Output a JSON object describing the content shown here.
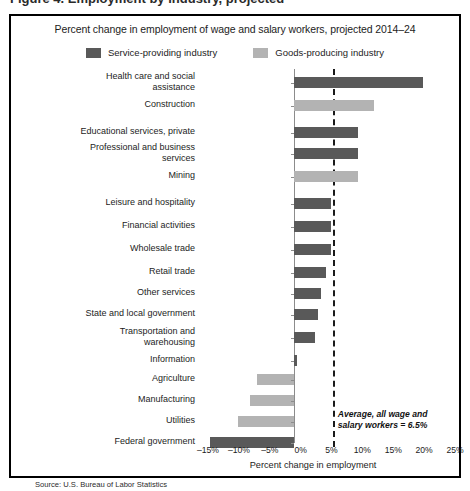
{
  "figure": {
    "clipped_header_text": "Figure 4. Employment by industry, projected",
    "source": "Source: U.S. Bureau of Labor Statistics"
  },
  "legend": {
    "entries": [
      {
        "label": "Service-providing industry",
        "color": "#595959",
        "key": "service"
      },
      {
        "label": "Goods-producing industry",
        "color": "#b3b3b3",
        "key": "goods"
      }
    ]
  },
  "chart_data": {
    "type": "bar",
    "orientation": "horizontal",
    "title": "Percent change in employment of wage and salary workers, projected 2014–24",
    "xlabel": "Percent change in employment",
    "ylabel": "",
    "xlim": [
      -15,
      25
    ],
    "xticks": [
      -15,
      -10,
      -5,
      0,
      5,
      10,
      15,
      20,
      25
    ],
    "xtick_labels": [
      "–15%",
      "–10%",
      "–5%",
      "0%",
      "5%",
      "10%",
      "15%",
      "20%",
      "25%"
    ],
    "grid": false,
    "legend_position": "top-center",
    "series": [
      {
        "name": "Service-providing industry",
        "color": "#595959"
      },
      {
        "name": "Goods-producing industry",
        "color": "#b3b3b3"
      }
    ],
    "categories": [
      "Health care and social\nassistance",
      "Construction",
      "Educational services, private",
      "Professional and business\nservices",
      "Mining",
      "Leisure and hospitality",
      "Financial activities",
      "Wholesale trade",
      "Retail trade",
      "Other services",
      "State and local government",
      "Transportation and\nwarehousing",
      "Information",
      "Agriculture",
      "Manufacturing",
      "Utilities",
      "Federal government"
    ],
    "values": [
      21.0,
      13.0,
      10.5,
      10.5,
      10.5,
      6.1,
      6.1,
      6.1,
      5.2,
      4.4,
      3.9,
      3.4,
      0.6,
      -6.0,
      -7.0,
      -9.0,
      -13.5
    ],
    "group": [
      "service",
      "goods",
      "service",
      "service",
      "goods",
      "service",
      "service",
      "service",
      "service",
      "service",
      "service",
      "service",
      "service",
      "goods",
      "goods",
      "goods",
      "service"
    ],
    "annotations": [
      {
        "name": "average-reference-line",
        "text": "Average, all wage and\nsalary workers =  6.5%",
        "value": 6.5,
        "style": "dashed-vertical"
      }
    ]
  }
}
